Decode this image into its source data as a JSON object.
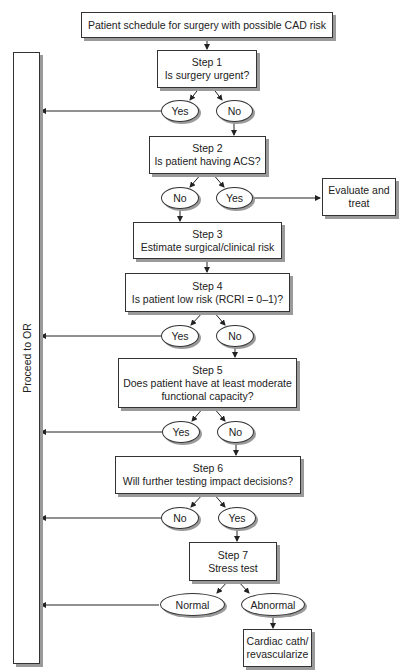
{
  "flowchart": {
    "start": "Patient schedule for surgery with possible CAD risk",
    "side_bar": "Proceed to OR",
    "steps": [
      {
        "title": "Step 1",
        "question": "Is surgery urgent?"
      },
      {
        "title": "Step 2",
        "question": "Is patient having ACS?"
      },
      {
        "title": "Step 3",
        "question": "Estimate surgical/clinical risk"
      },
      {
        "title": "Step 4",
        "question": "Is patient low risk (RCRI = 0–1)?"
      },
      {
        "title": "Step 5",
        "question_line1": "Does patient have at least moderate",
        "question_line2": "functional capacity?"
      },
      {
        "title": "Step 6",
        "question": "Will further testing impact decisions?"
      },
      {
        "title": "Step 7",
        "question": "Stress test"
      }
    ],
    "branches": {
      "step1": {
        "left": "Yes",
        "right": "No"
      },
      "step2": {
        "left": "No",
        "right": "Yes"
      },
      "step4": {
        "left": "Yes",
        "right": "No"
      },
      "step5": {
        "left": "Yes",
        "right": "No"
      },
      "step6": {
        "left": "No",
        "right": "Yes"
      },
      "step7": {
        "left": "Normal",
        "right": "Abnormal"
      }
    },
    "outcomes": {
      "evaluate_line1": "Evaluate and",
      "evaluate_line2": "treat",
      "cath_line1": "Cardiac cath/",
      "cath_line2": "revascularize"
    }
  }
}
